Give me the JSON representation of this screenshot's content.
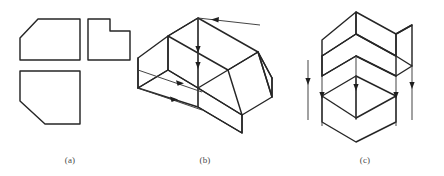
{
  "figure": {
    "kind": "engineering-drawing",
    "background_color": "#ffffff",
    "line_color": "#262626",
    "caption_color": "#4a4a4a",
    "panels": [
      {
        "id": "a",
        "caption": "(a)",
        "description": "Three orthographic views of a block with a chamfer",
        "views": [
          {
            "name": "top-left-view",
            "shape": "rectangle-with-chamfered-upper-left-corner",
            "points": "20,60 20,38 38,19 80,19 80,60"
          },
          {
            "name": "top-right-view",
            "shape": "L-shaped-stepped-rectangle",
            "points": "88,60 88,19 110,19 110,31 130,31 130,60"
          },
          {
            "name": "bottom-left-view",
            "shape": "rectangle-with-chamfered-lower-left-corner",
            "points": "20,71 80,71 80,124 45,124 20,101"
          }
        ]
      },
      {
        "id": "b",
        "caption": "(b)",
        "description": "Isometric pictorial of the chamfered block with projection arrows",
        "arrows": [
          {
            "name": "top-rear-edge-arrow",
            "direction": "left"
          },
          {
            "name": "vertical-edge-arrow-upper",
            "direction": "down"
          },
          {
            "name": "vertical-edge-arrow-lower",
            "direction": "down"
          },
          {
            "name": "base-edge-arrow-upper",
            "direction": "right"
          },
          {
            "name": "base-edge-arrow-lower",
            "direction": "right"
          }
        ]
      },
      {
        "id": "c",
        "caption": "(c)",
        "description": "Isometric block above its projected hexagonal outline with downward projection arrows",
        "arrows": [
          {
            "name": "projection-arrow-left-outer",
            "direction": "down"
          },
          {
            "name": "projection-arrow-left-inner",
            "direction": "down"
          },
          {
            "name": "projection-arrow-center",
            "direction": "down"
          },
          {
            "name": "projection-arrow-right-inner",
            "direction": "down"
          },
          {
            "name": "projection-arrow-right-outer",
            "direction": "down"
          }
        ]
      }
    ]
  }
}
